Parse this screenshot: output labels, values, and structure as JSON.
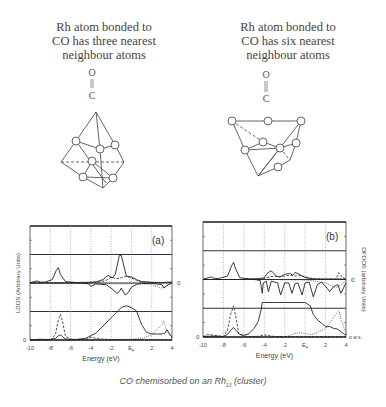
{
  "figure": {
    "left_structure": {
      "caption_lines": [
        "Rh atom bonded to",
        "CO has three nearest",
        "neighbour atoms"
      ],
      "molecule": {
        "top": "O",
        "bottom": "C"
      }
    },
    "right_structure": {
      "caption_lines": [
        "Rh atom bonded to",
        "CO has six nearest",
        "neighbour atoms"
      ],
      "molecule": {
        "top": "O",
        "bottom": "C"
      }
    },
    "caption": {
      "prefix": "CO chemisorbed on an Rh",
      "subscript": "13",
      "suffix": " (cluster)"
    }
  },
  "chart_data": [
    {
      "type": "line",
      "panel_label": "(a)",
      "ylabel": "LDOS (Arbitrary Units)",
      "xlabel": "Energy (eV)",
      "xlim": [
        -10,
        4
      ],
      "x_ticks": [
        "-10",
        "-8",
        "-6",
        "-4",
        "-2",
        "E_F",
        "2",
        "4"
      ],
      "right_zero_label": "0",
      "left_zero_label": "0",
      "series": [
        {
          "name": "upper solid (CO-Rh LDOS)",
          "style": "solid",
          "x": [
            -10,
            -9.3,
            -9,
            -8.5,
            -7.8,
            -7.4,
            -7.2,
            -7,
            -6.5,
            -5.5,
            -4.5,
            -3.5,
            -2.8,
            -2.3,
            -1.9,
            -1.6,
            -1.2,
            -1,
            -0.5,
            0,
            0.5,
            1,
            2,
            3,
            4
          ],
          "y": [
            0.02,
            0.12,
            0.05,
            0.05,
            0.2,
            0.75,
            0.9,
            0.5,
            0.08,
            0.03,
            0.04,
            0.06,
            0.2,
            0.45,
            0.3,
            0.5,
            1.6,
            1.6,
            0.4,
            0.35,
            0.2,
            0.08,
            0.04,
            0.03,
            0.05
          ]
        },
        {
          "name": "upper dashed",
          "style": "dashed",
          "x": [
            -10,
            -5,
            -4,
            -3,
            -2.5,
            -2,
            -1.5,
            -1,
            -0.5,
            0,
            0.5,
            1,
            2,
            3,
            4
          ],
          "y": [
            0.0,
            0.0,
            0.02,
            0.08,
            0.15,
            0.35,
            0.25,
            0.3,
            0.4,
            0.3,
            0.15,
            0.06,
            0.03,
            0.02,
            0.05
          ]
        },
        {
          "name": "overlap solid (negative dips)",
          "style": "solid",
          "x": [
            -10,
            -5,
            -4.2,
            -4,
            -3.5,
            -2.5,
            -2,
            -1.4,
            -1.2,
            -1,
            -0.6,
            -0.3,
            0,
            0.5,
            1,
            2,
            3,
            3.2,
            3.5,
            4
          ],
          "y": [
            0,
            0,
            -0.05,
            -0.2,
            -0.05,
            -0.1,
            -0.3,
            -0.6,
            -0.5,
            -0.3,
            -0.7,
            -0.55,
            -0.25,
            -0.08,
            -0.03,
            -0.02,
            -0.1,
            -0.3,
            -0.15,
            0
          ]
        },
        {
          "name": "overlap dotted",
          "style": "dotted",
          "x": [
            -10,
            -5,
            -3,
            -1,
            0,
            1,
            2,
            2.5,
            3,
            3.5,
            4
          ],
          "y": [
            0,
            0,
            -0.03,
            -0.05,
            -0.04,
            -0.05,
            -0.1,
            -0.2,
            -0.3,
            -0.15,
            0
          ]
        },
        {
          "name": "lower solid (Rh LDOS)",
          "style": "solid",
          "x": [
            -10,
            -9,
            -8,
            -7.5,
            -7.2,
            -7,
            -6.8,
            -6.5,
            -5.5,
            -4.5,
            -4,
            -3.5,
            -3,
            -2.5,
            -2,
            -1.5,
            -1,
            -0.5,
            0,
            0.5,
            1,
            1.5,
            2,
            2.5,
            3,
            3.3,
            3.5,
            4
          ],
          "y": [
            0.02,
            0.04,
            0.03,
            0.1,
            0.25,
            0.3,
            0.2,
            0.05,
            0.03,
            0.1,
            0.25,
            0.4,
            0.7,
            1.0,
            1.3,
            1.6,
            1.9,
            2.0,
            1.9,
            1.7,
            0.9,
            0.45,
            0.35,
            0.35,
            0.35,
            0.4,
            0.6,
            0.15
          ]
        },
        {
          "name": "lower dashed (CO orbitals)",
          "style": "dashed",
          "x": [
            -10,
            -8,
            -7.5,
            -7.2,
            -7,
            -6.8,
            -6.5,
            -6,
            -5,
            -4.5,
            -4,
            -3,
            -2,
            4
          ],
          "y": [
            0,
            0.02,
            0.3,
            1.2,
            1.5,
            1.1,
            0.2,
            0.05,
            0.02,
            0.03,
            0.15,
            0.05,
            0.03,
            0.02
          ]
        },
        {
          "name": "lower dotted",
          "style": "dotted",
          "x": [
            -10,
            -2,
            -1,
            0,
            1,
            2,
            2.5,
            3,
            3.2,
            3.5,
            4
          ],
          "y": [
            0,
            0,
            0.03,
            0.05,
            0.1,
            0.3,
            0.6,
            0.9,
            1.1,
            0.5,
            0.1
          ]
        }
      ]
    },
    {
      "type": "line",
      "panel_label": "(b)",
      "ylabel": "OPDOS (arbitrary Units)",
      "xlabel": "Energy (eV)",
      "xlim": [
        -10,
        4
      ],
      "x_ticks": [
        "-10",
        "-8",
        "-6",
        "-4",
        "-2",
        "E_F",
        "2",
        "4"
      ],
      "right_zero_label": "0",
      "left_zero_label": "0",
      "right_bottom_label": "o w.s.",
      "series": [
        {
          "name": "upper solid",
          "style": "solid",
          "x": [
            -10,
            -9.5,
            -9.2,
            -9,
            -8.5,
            -7.6,
            -7.2,
            -7,
            -6.8,
            -6.4,
            -5.5,
            -4.5,
            -4,
            -3.8,
            -3.5,
            -3.3,
            -3,
            -2.8,
            -2.5,
            -2,
            -1.5,
            -1.2,
            -1,
            -0.7,
            -0.3,
            0,
            0.5,
            1,
            2,
            3,
            4
          ],
          "y": [
            0.02,
            0.1,
            0.15,
            0.08,
            0.05,
            0.2,
            0.8,
            1.0,
            0.6,
            0.1,
            0.04,
            0.05,
            0.1,
            0.3,
            0.45,
            0.5,
            0.3,
            0.2,
            0.15,
            0.3,
            0.35,
            0.25,
            0.4,
            0.35,
            0.2,
            0.12,
            0.05,
            0.03,
            0.03,
            0.03,
            0.03
          ]
        },
        {
          "name": "upper dashed",
          "style": "dashed",
          "x": [
            -10,
            -4.5,
            -4,
            -3.5,
            -3,
            -2.5,
            -2,
            -1.5,
            -1,
            -0.5,
            0,
            0.5,
            1,
            2,
            3,
            3.3,
            3.6,
            4
          ],
          "y": [
            0,
            0,
            0.05,
            0.15,
            0.2,
            0.15,
            0.2,
            0.25,
            0.2,
            0.25,
            0.15,
            0.08,
            0.04,
            0.02,
            0.02,
            0.4,
            0.15,
            0.02
          ]
        },
        {
          "name": "overlap solid",
          "style": "solid",
          "x": [
            -10,
            -5,
            -4.4,
            -4.2,
            -4.1,
            -3.8,
            -3.6,
            -3.3,
            -3,
            -2.7,
            -2.4,
            -2,
            -1.6,
            -1.3,
            -1,
            -0.7,
            -0.3,
            0,
            0.4,
            0.8,
            1.2,
            1.6,
            2,
            2.4,
            2.8,
            3.2,
            3.5,
            4
          ],
          "y": [
            0,
            0,
            -0.05,
            -0.8,
            -0.2,
            -0.1,
            -0.7,
            -0.1,
            -0.15,
            -0.2,
            -0.9,
            -0.2,
            -0.2,
            -0.8,
            -0.25,
            -0.2,
            -0.9,
            -0.2,
            -0.15,
            -1.0,
            -0.3,
            -0.15,
            -0.4,
            -0.7,
            -0.4,
            -0.3,
            -0.8,
            -0.2
          ]
        },
        {
          "name": "overlap dotted",
          "style": "dotted",
          "x": [
            -10,
            -4,
            0,
            1,
            2,
            2.5,
            3,
            3.5,
            4
          ],
          "y": [
            0,
            0,
            -0.03,
            -0.1,
            -0.2,
            -0.35,
            -0.5,
            -0.3,
            -0.05
          ]
        },
        {
          "name": "lower solid",
          "style": "solid",
          "x": [
            -10,
            -9,
            -8,
            -7.6,
            -7.2,
            -7,
            -6.8,
            -6.4,
            -6,
            -5.5,
            -5,
            -4.6,
            -4.3,
            -4.2,
            -4,
            -3,
            -2,
            -1,
            0,
            0.5,
            0.8,
            1.2,
            1.6,
            2,
            2.4,
            2.8,
            3.2,
            3.5,
            4
          ],
          "y": [
            0.03,
            0.05,
            0.03,
            0.15,
            0.45,
            0.55,
            0.4,
            0.15,
            0.1,
            0.2,
            0.5,
            0.9,
            1.6,
            2.0,
            2.0,
            2.0,
            2.0,
            2.0,
            2.0,
            1.8,
            1.3,
            1.0,
            0.8,
            0.6,
            0.6,
            0.5,
            0.45,
            0.3,
            0.1
          ]
        },
        {
          "name": "lower dashed",
          "style": "dashed",
          "x": [
            -10,
            -9.5,
            -8,
            -7.6,
            -7.3,
            -7,
            -6.8,
            -6.5,
            -6,
            -5,
            -4.5,
            -4,
            -3,
            4
          ],
          "y": [
            0.02,
            0.15,
            0.03,
            0.4,
            1.3,
            1.8,
            1.2,
            0.2,
            0.05,
            0.02,
            0.05,
            0.12,
            0.03,
            0.02
          ]
        },
        {
          "name": "lower dotted",
          "style": "dotted",
          "x": [
            -10,
            -2,
            -1.5,
            -1,
            -0.5,
            0,
            0.5,
            1,
            2,
            2.5,
            3,
            3.3,
            3.6,
            4
          ],
          "y": [
            0,
            0,
            0.1,
            0.2,
            0.25,
            0.2,
            0.15,
            0.2,
            0.5,
            0.9,
            1.3,
            1.5,
            0.9,
            0.2
          ]
        }
      ]
    }
  ]
}
